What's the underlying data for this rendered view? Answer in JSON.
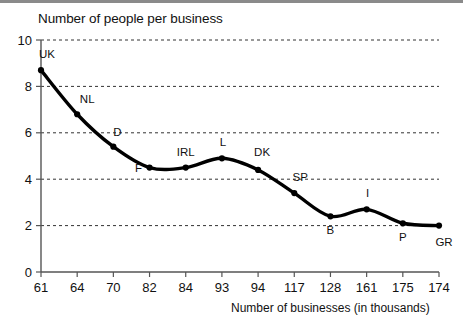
{
  "chart_data": {
    "type": "line",
    "title": "Number of people per business",
    "xlabel": "Number of businesses (in thousands)",
    "ylabel": "",
    "categories": [
      "61",
      "64",
      "70",
      "82",
      "84",
      "93",
      "94",
      "117",
      "128",
      "161",
      "175",
      "174"
    ],
    "point_labels": [
      "UK",
      "NL",
      "D",
      "F",
      "IRL",
      "L",
      "DK",
      "SP",
      "B",
      "I",
      "P",
      "GR"
    ],
    "values": [
      8.7,
      6.8,
      5.4,
      4.5,
      4.5,
      4.9,
      4.4,
      3.4,
      2.4,
      2.7,
      2.1,
      2.0
    ],
    "ylim": [
      0,
      10
    ],
    "yticks": [
      0,
      2,
      4,
      6,
      8,
      10
    ],
    "ytick_labels": [
      "0",
      "2",
      "4",
      "6",
      "8",
      "10"
    ],
    "grid": true,
    "grid_style": "dashed-horizontal",
    "legend": "none",
    "line_color": "#000000",
    "marker_color": "#000000",
    "axis_color": "#555555"
  },
  "label_offsets": [
    {
      "name": "UK",
      "dx": 6,
      "dy": -12
    },
    {
      "name": "NL",
      "dx": 10,
      "dy": -11
    },
    {
      "name": "D",
      "dx": 4,
      "dy": -11
    },
    {
      "name": "F",
      "dx": -11,
      "dy": 4
    },
    {
      "name": "IRL",
      "dx": 0,
      "dy": -12
    },
    {
      "name": "L",
      "dx": 1,
      "dy": -12
    },
    {
      "name": "DK",
      "dx": 4,
      "dy": -14
    },
    {
      "name": "SP",
      "dx": 6,
      "dy": -12
    },
    {
      "name": "B",
      "dx": 0,
      "dy": 18
    },
    {
      "name": "I",
      "dx": 1,
      "dy": -12
    },
    {
      "name": "P",
      "dx": 0,
      "dy": 18
    },
    {
      "name": "GR",
      "dx": 5,
      "dy": 20
    }
  ]
}
